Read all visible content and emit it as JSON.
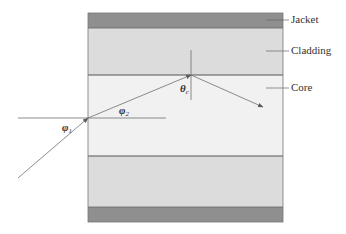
{
  "figure": {
    "layers": [
      {
        "name": "jacket-top",
        "label": "Jacket",
        "y": 13,
        "height": 15,
        "color": "#8f8f8f"
      },
      {
        "name": "cladding-top",
        "label": "Cladding",
        "y": 28,
        "height": 47,
        "color": "#dcdcdc"
      },
      {
        "name": "core",
        "label": "Core",
        "y": 75,
        "height": 81,
        "color": "#f1f1f1"
      },
      {
        "name": "cladding-bottom",
        "label": "",
        "y": 156,
        "height": 51,
        "color": "#dcdcdc"
      },
      {
        "name": "jacket-bottom",
        "label": "",
        "y": 207,
        "height": 15,
        "color": "#8f8f8f"
      }
    ],
    "labels": {
      "jacket": "Jacket",
      "cladding": "Cladding",
      "core": "Core"
    },
    "angles": {
      "phi1": {
        "symbol": "φ",
        "sub": "1"
      },
      "phi2": {
        "symbol": "φ",
        "sub": "2"
      },
      "theta_c": {
        "symbol": "θ",
        "sub": "c"
      }
    },
    "colors": {
      "ray": "#6e6e6e",
      "outline": "#555555",
      "text": "#333333"
    }
  }
}
